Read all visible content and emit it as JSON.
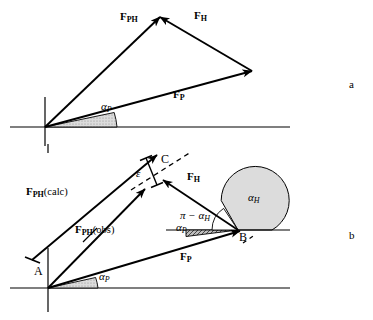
{
  "figure": {
    "type": "vector-diagram",
    "panels": [
      {
        "id": "a",
        "label": "a"
      },
      {
        "id": "b",
        "label": "b"
      }
    ]
  },
  "panel_a": {
    "label": "a",
    "vectors": [
      {
        "name": "F_PH",
        "base": "F",
        "sub": "PH",
        "qualifier": "",
        "label_x": 120,
        "label_y": 17
      },
      {
        "name": "F_H",
        "base": "F",
        "sub": "H",
        "qualifier": "",
        "label_x": 194,
        "label_y": 16
      },
      {
        "name": "F_P",
        "base": "F",
        "sub": "P",
        "qualifier": "",
        "label_x": 173,
        "label_y": 93
      }
    ],
    "angles": [
      {
        "name": "alpha_P",
        "base": "α",
        "sub": "P",
        "label_x": 101,
        "label_y": 106
      }
    ],
    "geometry": {
      "origin": [
        45,
        127
      ],
      "apex": [
        160,
        15
      ],
      "right_vertex": [
        252,
        70
      ],
      "baseline_x1": 10,
      "baseline_x2": 290,
      "baseline_y": 127,
      "axis_x": 45,
      "axis_y1": 98,
      "axis_y2": 145
    }
  },
  "panel_b": {
    "label": "b",
    "vectors": [
      {
        "name": "F_PH(calc)",
        "base": "F",
        "sub": "PH",
        "qualifier": "(calc)",
        "label_x": 26,
        "label_y": 192
      },
      {
        "name": "F_PH(obs)",
        "base": "F",
        "sub": "PH",
        "qualifier": "(obs)",
        "label_x": 75,
        "label_y": 230
      },
      {
        "name": "F_H",
        "base": "F",
        "sub": "H",
        "qualifier": "",
        "label_x": 187,
        "label_y": 177
      },
      {
        "name": "F_P",
        "base": "F",
        "sub": "P",
        "qualifier": "",
        "label_x": 180,
        "label_y": 257
      }
    ],
    "angles": [
      {
        "name": "alpha_H",
        "base": "α",
        "sub": "H",
        "label_x": 248,
        "label_y": 198
      },
      {
        "name": "pi_minus_alpha_H",
        "text": "π − α",
        "sub": "H",
        "label_x": 180,
        "label_y": 216
      },
      {
        "name": "alpha_P_at_B",
        "base": "α",
        "sub": "P",
        "label_x": 176,
        "label_y": 228
      },
      {
        "name": "alpha_P_at_A",
        "base": "α",
        "sub": "P",
        "label_x": 99,
        "label_y": 277
      }
    ],
    "points": [
      {
        "name": "A",
        "label": "A",
        "label_x": 34,
        "label_y": 272
      },
      {
        "name": "B",
        "label": "B",
        "label_x": 239,
        "label_y": 237
      },
      {
        "name": "C",
        "label": "C",
        "label_x": 161,
        "label_y": 160
      }
    ],
    "error_bracket": {
      "name": "epsilon",
      "label": "ε",
      "label_x": 136,
      "label_y": 174
    },
    "geometry": {
      "origin_A": [
        48,
        288
      ],
      "tip_calc": [
        155,
        155
      ],
      "tip_obs": [
        143,
        188
      ],
      "point_C": [
        156,
        175
      ],
      "point_B": [
        238,
        230
      ],
      "baseline_x1": 10,
      "baseline_x2": 290,
      "baseline_y": 288,
      "axis_x": 48,
      "axis_y1": 250,
      "axis_y2": 310
    }
  },
  "style": {
    "stroke": "#000000",
    "fill_wedge": "#9a9a9a",
    "fill_sector": "#d9d9d9",
    "background": "#ffffff"
  }
}
